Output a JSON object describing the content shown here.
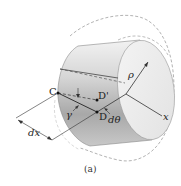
{
  "figure": {
    "caption": "(a)",
    "labels": {
      "point_c": "C",
      "point_d_prime": "D'",
      "point_d": "D",
      "gamma": "γ",
      "d_theta": "dθ",
      "rho": "ρ",
      "x_axis": "x",
      "dx": "dx"
    },
    "colors": {
      "cylinder_light": "#e6e6e6",
      "cylinder_shade": "#a9a9a9",
      "face": "#ececec",
      "line": "#333333",
      "dashed": "#9a9a9a",
      "point": "#111111"
    }
  }
}
